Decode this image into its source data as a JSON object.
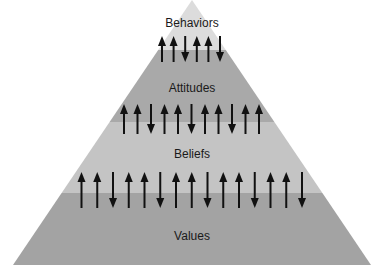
{
  "diagram": {
    "type": "pyramid",
    "colors": {
      "behaviors": "#dcdcdc",
      "attitudes": "#a9a9a9",
      "beliefs": "#c4c4c4",
      "values": "#a3a3a3",
      "arrow": "#111111"
    },
    "layers": [
      {
        "label": "Behaviors",
        "arrows": [
          "up",
          "up",
          "down",
          "up",
          "up",
          "down"
        ]
      },
      {
        "label": "Attitudes",
        "arrows": [
          "up",
          "up",
          "down",
          "up",
          "up",
          "down",
          "up",
          "up",
          "down",
          "up",
          "up"
        ]
      },
      {
        "label": "Beliefs",
        "arrows": [
          "up",
          "up",
          "down",
          "up",
          "up",
          "down",
          "up",
          "up",
          "down",
          "up",
          "up",
          "down",
          "up",
          "up",
          "down"
        ]
      },
      {
        "label": "Values",
        "arrows": []
      }
    ]
  }
}
